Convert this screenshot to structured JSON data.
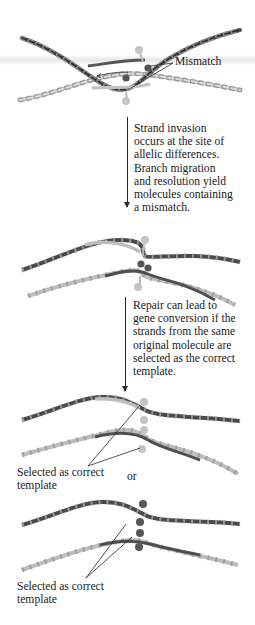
{
  "figure": {
    "panels": [
      {
        "id": "panel-1",
        "labels": {
          "mismatch": "Mismatch"
        }
      },
      {
        "id": "panel-2"
      },
      {
        "id": "panel-3",
        "labels": {
          "selected_line1": "Selected as correct",
          "selected_line2": "template",
          "or": "or"
        }
      },
      {
        "id": "panel-4",
        "labels": {
          "selected_line1": "Selected as correct",
          "selected_line2": "template"
        }
      }
    ],
    "steps": [
      {
        "lines": [
          "Strand invasion",
          "occurs at the site of",
          "allelic differences.",
          "Branch migration",
          "and resolution yield",
          "molecules containing",
          "a mismatch."
        ]
      },
      {
        "lines": [
          "Repair can lead to",
          "gene conversion if the",
          "strands from the same",
          "original molecule are",
          "selected as the correct",
          "template."
        ]
      }
    ],
    "colors": {
      "dark_strand": "#4a4a4a",
      "light_strand": "#b8b8b8",
      "dark_base": "#555555",
      "light_base": "#bdbdbd",
      "text": "#1a1a1a",
      "background": "#ffffff"
    }
  }
}
